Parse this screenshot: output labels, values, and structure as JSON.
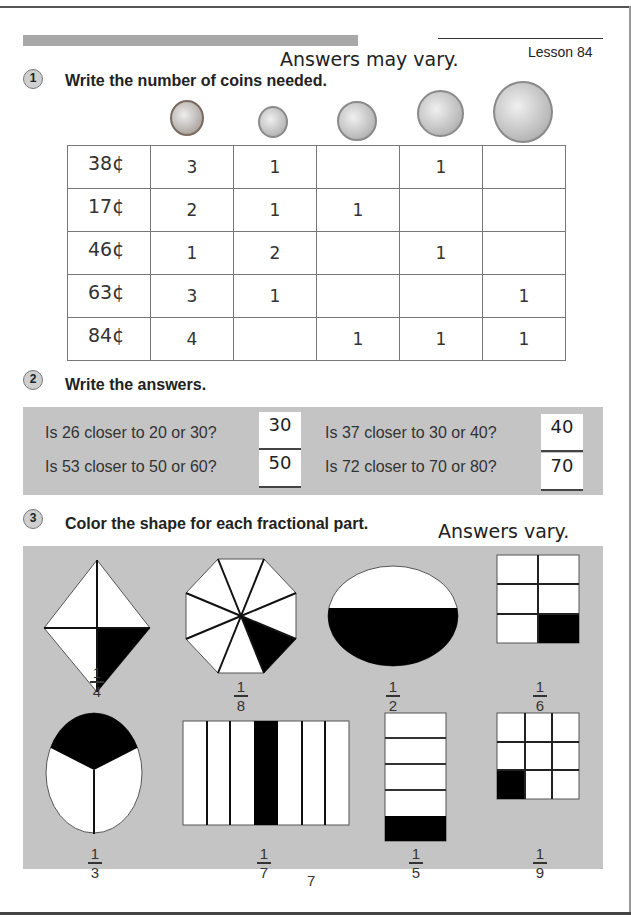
{
  "header": {
    "lesson": "Lesson 84",
    "answers_note": "Answers may vary."
  },
  "section1": {
    "number": "1",
    "title": "Write the number of coins needed.",
    "coins": [
      "penny-icon",
      "dime-icon",
      "nickel-icon",
      "quarter-icon",
      "half-dollar-icon"
    ],
    "rows": [
      {
        "amount": "38¢",
        "cells": [
          "3",
          "1",
          "",
          "1",
          ""
        ]
      },
      {
        "amount": "17¢",
        "cells": [
          "2",
          "1",
          "1",
          "",
          ""
        ]
      },
      {
        "amount": "46¢",
        "cells": [
          "1",
          "2",
          "",
          "1",
          ""
        ]
      },
      {
        "amount": "63¢",
        "cells": [
          "3",
          "1",
          "",
          "",
          "1"
        ]
      },
      {
        "amount": "84¢",
        "cells": [
          "4",
          "",
          "1",
          "1",
          "1"
        ]
      }
    ]
  },
  "section2": {
    "number": "2",
    "title": "Write the answers.",
    "questions": [
      {
        "text": "Is 26 closer to 20 or 30?",
        "answer": "30"
      },
      {
        "text": "Is 37 closer to 30 or 40?",
        "answer": "40"
      },
      {
        "text": "Is 53 closer to 50 or 60?",
        "answer": "50"
      },
      {
        "text": "Is 72 closer to 70 or 80?",
        "answer": "70"
      }
    ]
  },
  "section3": {
    "number": "3",
    "title": "Color the shape for each fractional part.",
    "note": "Answers vary.",
    "shapes": [
      {
        "shape": "diamond",
        "numerator": "1",
        "denominator": "4"
      },
      {
        "shape": "octagon",
        "numerator": "1",
        "denominator": "8"
      },
      {
        "shape": "ellipse",
        "numerator": "1",
        "denominator": "2"
      },
      {
        "shape": "grid-2x3",
        "numerator": "1",
        "denominator": "6"
      },
      {
        "shape": "circle-thirds",
        "numerator": "1",
        "denominator": "3"
      },
      {
        "shape": "strips-7",
        "numerator": "1",
        "denominator": "7"
      },
      {
        "shape": "strips-5",
        "numerator": "1",
        "denominator": "5"
      },
      {
        "shape": "grid-3x3",
        "numerator": "1",
        "denominator": "9"
      }
    ]
  },
  "footer": {
    "page_number": "7"
  },
  "colors": {
    "panel": "#c4c4c4",
    "fill": "#000000",
    "badge": "#cfcfcf"
  }
}
